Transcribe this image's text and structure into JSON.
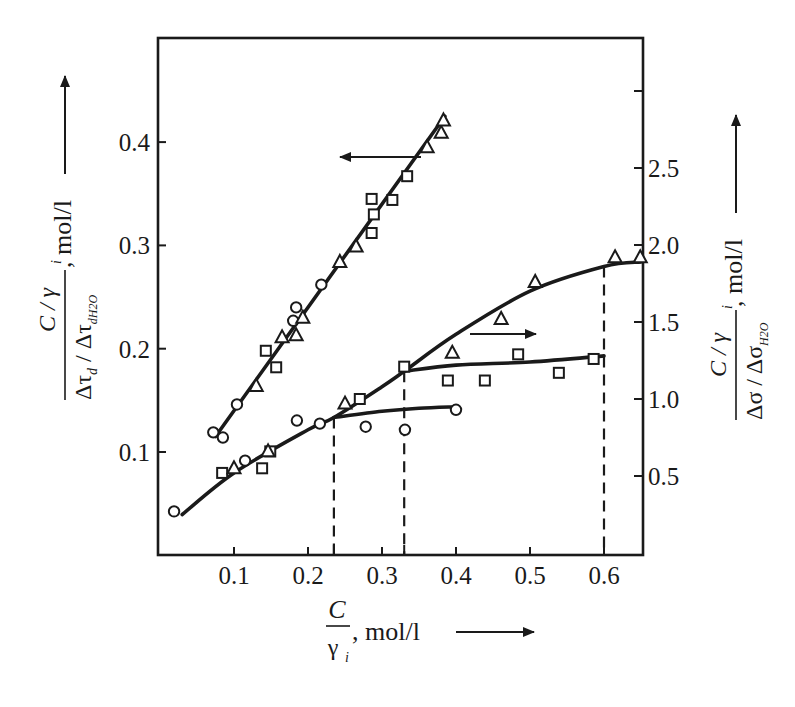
{
  "chart_data": {
    "type": "scatter",
    "title": "",
    "xlabel": "C/γi, mol/l",
    "xlabel_parts": {
      "numerator": "C",
      "denominator": "γ",
      "denominator_sub": "i",
      "unit": ", mol/l"
    },
    "ylabel_left": "(C/γi) / (Δτd / Δτd H2O), mol/l",
    "ylabel_left_parts": {
      "numerator": "C / γ",
      "numerator_sub": "i",
      "denominator": "Δτ",
      "denominator_sub1": "d",
      "denominator_mid": " / Δτ",
      "denominator_sub2": "dH2O",
      "unit": ", mol/l"
    },
    "ylabel_right": "(C/γi) / (Δσ / Δσ H2O), mol/l",
    "ylabel_right_parts": {
      "numerator": "C / γ",
      "numerator_sub": "i",
      "denominator": "Δσ / Δσ",
      "denominator_sub": "H2O",
      "unit": ", mol/l"
    },
    "xlim": [
      0,
      0.66
    ],
    "ylim_left": [
      0,
      0.5
    ],
    "ylim_right": [
      0,
      3.2
    ],
    "x_ticks": [
      "0.1",
      "0.2",
      "0.3",
      "0.4",
      "0.5",
      "0.6"
    ],
    "x_tick_values": [
      0.1,
      0.2,
      0.3,
      0.4,
      0.5,
      0.6
    ],
    "x_extra_ticks": [
      0.235,
      0.33
    ],
    "y_left_ticks": [
      "0.1",
      "0.2",
      "0.3",
      "0.4"
    ],
    "y_left_tick_values": [
      0.1,
      0.2,
      0.3,
      0.4
    ],
    "y_right_ticks": [
      "0.5",
      "1.0",
      "1.5",
      "2.0",
      "2.5",
      ""
    ],
    "y_right_tick_values": [
      0.5,
      1.0,
      1.5,
      2.0,
      2.5,
      3.0
    ],
    "grid": false,
    "legend": null,
    "markers": {
      "circle": "○",
      "square": "□",
      "triangle": "△"
    },
    "annotations": [
      {
        "type": "arrow",
        "direction": "left",
        "meaning": "steep line refers to left axis"
      },
      {
        "type": "arrow",
        "direction": "right",
        "meaning": "lower curves refer to right axis"
      },
      {
        "type": "dashed-vline",
        "x": 0.235
      },
      {
        "type": "dashed-vline",
        "x": 0.33
      },
      {
        "type": "dashed-vline",
        "x": 0.6
      }
    ],
    "series": [
      {
        "name": "Left axis – circles",
        "axis": "left",
        "marker": "circle",
        "x": [
          0.072,
          0.085,
          0.104,
          0.18,
          0.184,
          0.218
        ],
        "y": [
          0.119,
          0.114,
          0.146,
          0.227,
          0.24,
          0.262
        ]
      },
      {
        "name": "Left axis – squares",
        "axis": "left",
        "marker": "square",
        "x": [
          0.143,
          0.157,
          0.286,
          0.289,
          0.286,
          0.314,
          0.334
        ],
        "y": [
          0.198,
          0.182,
          0.312,
          0.33,
          0.345,
          0.344,
          0.367
        ]
      },
      {
        "name": "Left axis – triangles",
        "axis": "left",
        "marker": "triangle",
        "x": [
          0.13,
          0.165,
          0.184,
          0.193,
          0.243,
          0.265,
          0.361,
          0.38,
          0.383
        ],
        "y": [
          0.164,
          0.211,
          0.213,
          0.23,
          0.284,
          0.299,
          0.395,
          0.409,
          0.421
        ]
      },
      {
        "name": "Left axis – fitted line",
        "axis": "left",
        "type": "line",
        "x": [
          0.075,
          0.385
        ],
        "y": [
          0.115,
          0.425
        ]
      },
      {
        "name": "Right axis – circles",
        "axis": "right",
        "marker": "circle",
        "x": [
          0.019,
          0.115,
          0.185,
          0.216,
          0.278,
          0.331,
          0.4
        ],
        "y": [
          0.27,
          0.6,
          0.86,
          0.84,
          0.82,
          0.8,
          0.93
        ]
      },
      {
        "name": "Right axis – squares",
        "axis": "right",
        "marker": "square",
        "x": [
          0.084,
          0.138,
          0.149,
          0.27,
          0.33,
          0.389,
          0.439,
          0.484,
          0.539,
          0.586
        ],
        "y": [
          0.52,
          0.55,
          0.66,
          1.0,
          1.21,
          1.12,
          1.12,
          1.29,
          1.17,
          1.26
        ]
      },
      {
        "name": "Right axis – triangles",
        "axis": "right",
        "marker": "triangle",
        "x": [
          0.1,
          0.146,
          0.25,
          0.395,
          0.461,
          0.507,
          0.615,
          0.649
        ],
        "y": [
          0.55,
          0.66,
          0.97,
          1.3,
          1.52,
          1.76,
          1.92,
          1.92
        ]
      },
      {
        "name": "Right axis – main curve",
        "axis": "right",
        "type": "line",
        "x": [
          0.03,
          0.1,
          0.2,
          0.235,
          0.3,
          0.33,
          0.4,
          0.5,
          0.6,
          0.65
        ],
        "y": [
          0.25,
          0.52,
          0.8,
          0.88,
          1.08,
          1.18,
          1.42,
          1.7,
          1.86,
          1.89
        ]
      },
      {
        "name": "Right axis – squares plateau curve",
        "axis": "right",
        "type": "line",
        "x": [
          0.33,
          0.4,
          0.5,
          0.6
        ],
        "y": [
          1.18,
          1.22,
          1.24,
          1.28
        ]
      },
      {
        "name": "Right axis – circles plateau curve",
        "axis": "right",
        "type": "line",
        "x": [
          0.235,
          0.3,
          0.35,
          0.4
        ],
        "y": [
          0.88,
          0.92,
          0.94,
          0.95
        ]
      }
    ]
  }
}
